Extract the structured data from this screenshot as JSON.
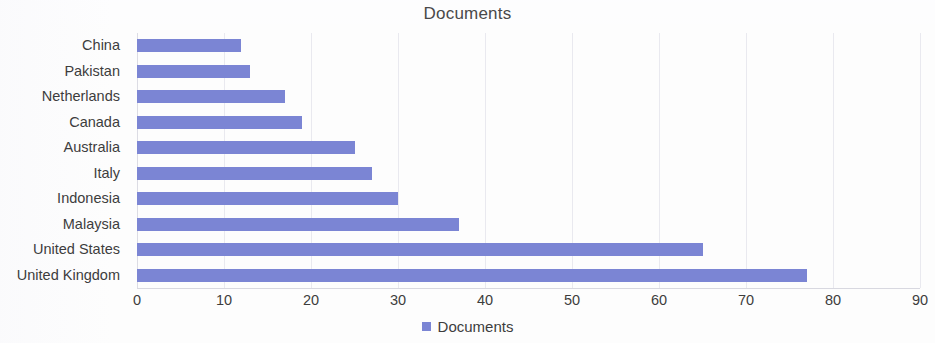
{
  "chart_data": {
    "type": "bar",
    "orientation": "horizontal",
    "title": "Documents",
    "xlabel": "",
    "ylabel": "",
    "xlim": [
      0,
      90
    ],
    "xticks": [
      0,
      10,
      20,
      30,
      40,
      50,
      60,
      70,
      80,
      90
    ],
    "xtick_labels": [
      "0",
      "10",
      "20",
      "30",
      "40",
      "50",
      "60",
      "70",
      "80",
      "90"
    ],
    "grid": "vertical",
    "legend_position": "bottom-center",
    "legend": [
      "Documents"
    ],
    "series_name": "Documents",
    "bar_color": "#7b85d4",
    "categories": [
      "China",
      "Pakistan",
      "Netherlands",
      "Canada",
      "Australia",
      "Italy",
      "Indonesia",
      "Malaysia",
      "United States",
      "United Kingdom"
    ],
    "values": [
      12,
      13,
      17,
      19,
      25,
      27,
      30,
      37,
      65,
      77
    ],
    "series": [
      {
        "name": "Documents",
        "values": [
          12,
          13,
          17,
          19,
          25,
          27,
          30,
          37,
          65,
          77
        ]
      }
    ]
  },
  "legend": {
    "label": "Documents",
    "swatch_color": "#7b85d4"
  },
  "colors": {
    "bar": "#7b85d4",
    "gridline": "#e9e9ef",
    "text": "#3d3d3d",
    "background": "#fdfdfd"
  }
}
